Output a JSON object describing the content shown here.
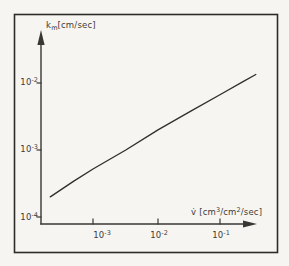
{
  "figure": {
    "y_axis": {
      "label": {
        "base": "k",
        "sub": "m",
        "unit": "[cm/sec]"
      },
      "ticks": [
        {
          "base": "10",
          "exp": "-2"
        },
        {
          "base": "10",
          "exp": "-3"
        },
        {
          "base": "10",
          "exp": "-4"
        }
      ]
    },
    "x_axis": {
      "label": {
        "symbol": "v̇",
        "p0": " [cm",
        "s0": "3",
        "p1": "/cm",
        "s1": "2",
        "p2": "/sec]"
      },
      "ticks": [
        {
          "base": "10",
          "exp": "-3"
        },
        {
          "base": "10",
          "exp": "-2"
        },
        {
          "base": "10",
          "exp": "-1"
        }
      ]
    }
  },
  "colors": {
    "ink": "#3a3733",
    "frame": "#2e2c29",
    "paper": "#f6f5f1"
  },
  "chart_data": {
    "type": "line",
    "title": "",
    "xlabel": "v̇ [cm³/cm²/sec]",
    "ylabel": "km [cm/sec]",
    "x_scale": "log",
    "y_scale": "log",
    "xlim": [
      0.00016,
      0.4
    ],
    "ylim": [
      8e-05,
      0.05
    ],
    "x_ticks": [
      0.001,
      0.01,
      0.1
    ],
    "y_ticks": [
      0.0001,
      0.001,
      0.01
    ],
    "grid": false,
    "legend": false,
    "series": [
      {
        "name": "mass-transfer coefficient vs volumetric flux",
        "points": [
          [
            0.00022,
            0.0002
          ],
          [
            0.0005,
            0.00034
          ],
          [
            0.001,
            0.00052
          ],
          [
            0.0032,
            0.001
          ],
          [
            0.01,
            0.002
          ],
          [
            0.032,
            0.0038
          ],
          [
            0.1,
            0.0071
          ],
          [
            0.2,
            0.0104
          ],
          [
            0.32,
            0.0134
          ]
        ]
      }
    ]
  }
}
